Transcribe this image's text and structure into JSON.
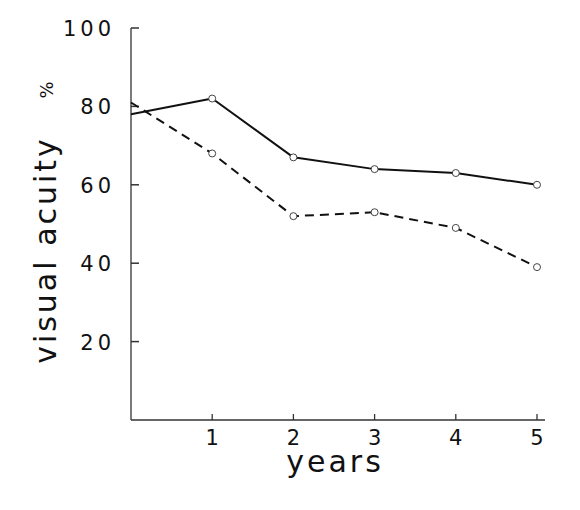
{
  "chart_data": {
    "type": "line",
    "title": "",
    "xlabel": "years",
    "ylabel": "visual acuity",
    "ylabel_unit": "%",
    "x": [
      0,
      1,
      2,
      3,
      4,
      5
    ],
    "x_ticks": [
      1,
      2,
      3,
      4,
      5
    ],
    "y_ticks": [
      20,
      40,
      60,
      80,
      100
    ],
    "xlim": [
      0,
      5
    ],
    "ylim": [
      0,
      100
    ],
    "grid": false,
    "legend": null,
    "series": [
      {
        "name": "solid line",
        "style": "solid",
        "values": [
          78,
          82,
          67,
          64,
          63,
          60
        ],
        "markers_from_index": 1
      },
      {
        "name": "dashed line",
        "style": "dashed",
        "values": [
          81,
          68,
          52,
          53,
          49,
          39
        ],
        "markers_from_index": 1
      }
    ]
  },
  "labels": {
    "xlabel": "years",
    "ylabel": "visual acuity",
    "unit": "%"
  },
  "colors": {
    "line": "#111111",
    "marker_fill": "#ffffff",
    "axis": "#333333"
  }
}
